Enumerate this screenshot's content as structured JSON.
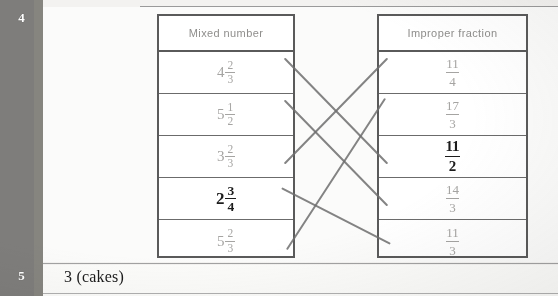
{
  "page": {
    "top_partial_text": "",
    "background_color": "#f3f2f0",
    "number_column_color": "#7e7d7b",
    "line_color": "#6f6f6f",
    "faint_print_color": "#a5a4a2",
    "emphasis_color": "#1c1c1c"
  },
  "rows": [
    {
      "number": "4"
    },
    {
      "number": "5",
      "answer": "3 (cakes)"
    }
  ],
  "tables": {
    "mixed": {
      "header": "Mixed number",
      "cells": [
        {
          "whole": "4",
          "numerator": "2",
          "denominator": "3",
          "emphasis": false
        },
        {
          "whole": "5",
          "numerator": "1",
          "denominator": "2",
          "emphasis": false
        },
        {
          "whole": "3",
          "numerator": "2",
          "denominator": "3",
          "emphasis": false
        },
        {
          "whole": "2",
          "numerator": "3",
          "denominator": "4",
          "emphasis": true
        },
        {
          "whole": "5",
          "numerator": "2",
          "denominator": "3",
          "emphasis": false
        }
      ]
    },
    "improper": {
      "header": "Improper fraction",
      "cells": [
        {
          "numerator": "11",
          "denominator": "4",
          "emphasis": false
        },
        {
          "numerator": "17",
          "denominator": "3",
          "emphasis": false
        },
        {
          "numerator": "11",
          "denominator": "2",
          "emphasis": true
        },
        {
          "numerator": "14",
          "denominator": "3",
          "emphasis": false
        },
        {
          "numerator": "11",
          "denominator": "3",
          "emphasis": false
        }
      ]
    }
  },
  "connections": [
    {
      "from_row": 0,
      "to_row": 2
    },
    {
      "from_row": 1,
      "to_row": 3
    },
    {
      "from_row": 2,
      "to_row": 0
    },
    {
      "from_row": 3,
      "to_row": 4
    },
    {
      "from_row": 4,
      "to_row": 1
    }
  ]
}
